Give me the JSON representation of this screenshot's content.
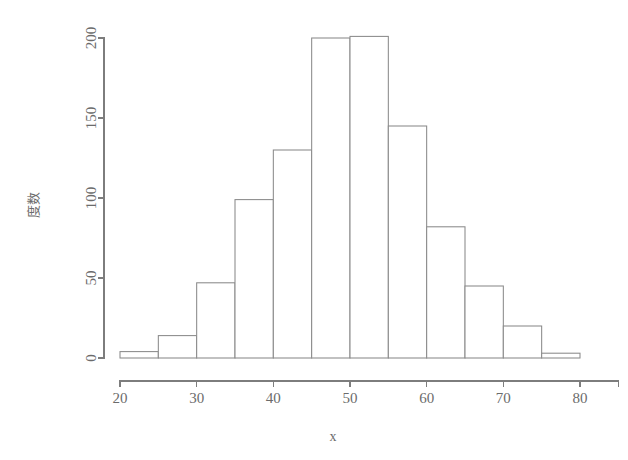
{
  "chart_data": {
    "type": "bar",
    "title": "",
    "subtitle": "",
    "xlabel": "x",
    "ylabel": "度数",
    "grid": false,
    "legend": "none",
    "bin_width": 5,
    "xlim": [
      20,
      85
    ],
    "ylim": [
      0,
      205
    ],
    "xticks": [
      20,
      30,
      40,
      50,
      60,
      70,
      80
    ],
    "xtick_labels": [
      "20",
      "30",
      "40",
      "50",
      "60",
      "70",
      "80"
    ],
    "yticks": [
      0,
      50,
      100,
      150,
      200
    ],
    "ytick_labels": [
      "0",
      "50",
      "100",
      "150",
      "200"
    ],
    "categories": [
      "20-25",
      "25-30",
      "30-35",
      "35-40",
      "40-45",
      "45-50",
      "50-55",
      "55-60",
      "60-65",
      "65-70",
      "70-75",
      "75-80"
    ],
    "bin_starts": [
      20,
      25,
      30,
      35,
      40,
      45,
      50,
      55,
      60,
      65,
      70,
      75
    ],
    "bin_ends": [
      25,
      30,
      35,
      40,
      45,
      50,
      55,
      60,
      65,
      70,
      75,
      80
    ],
    "values": [
      4,
      14,
      47,
      99,
      130,
      200,
      201,
      145,
      82,
      45,
      20,
      3
    ],
    "series": [
      {
        "name": "度数",
        "values": [
          4,
          14,
          47,
          99,
          130,
          200,
          201,
          145,
          82,
          45,
          20,
          3
        ]
      }
    ],
    "colors": {
      "bar_fill": "#ffffff",
      "bar_stroke": "#8a8a8a",
      "axis": "#7d7d7d",
      "text": "#6b6b6b",
      "background": "#ffffff"
    }
  }
}
